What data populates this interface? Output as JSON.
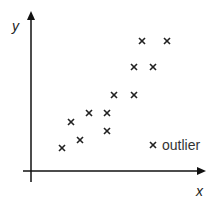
{
  "chart_data": {
    "type": "scatter",
    "title": "",
    "xlabel": "x",
    "ylabel": "y",
    "grid": false,
    "ticks": "none",
    "points_px": [
      [
        62,
        148
      ],
      [
        71,
        122
      ],
      [
        80,
        140
      ],
      [
        89,
        113
      ],
      [
        107,
        113
      ],
      [
        107,
        131
      ],
      [
        114,
        95
      ],
      [
        134,
        95
      ],
      [
        134,
        67
      ],
      [
        153,
        67
      ],
      [
        142,
        41
      ],
      [
        167,
        41
      ]
    ],
    "outlier_px": [
      153,
      145
    ],
    "annotation": "outlier"
  },
  "labels": {
    "x": "x",
    "y": "y",
    "outlier": "outlier"
  }
}
